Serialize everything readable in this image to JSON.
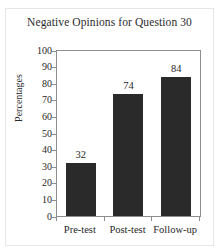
{
  "chart_data": {
    "type": "bar",
    "title": "Negative Opinions for Question 30",
    "xlabel": "",
    "ylabel": "Percentages",
    "categories": [
      "Pre-test",
      "Post-test",
      "Follow-up"
    ],
    "values": [
      32,
      74,
      84
    ],
    "data_labels": [
      "32",
      "74",
      "84"
    ],
    "ylim": [
      0,
      100
    ],
    "ytick_step": 10,
    "ytick_labels": [
      "100",
      "90",
      "80",
      "70",
      "60",
      "50",
      "40",
      "30",
      "20",
      "10",
      "0"
    ],
    "grid": false,
    "legend": false,
    "legend_position": "none",
    "bar_color": "#2a2a2a",
    "frame_color": "#8d8d8d",
    "background_color": "#ffffff",
    "text_color": "#1f1f1f"
  }
}
